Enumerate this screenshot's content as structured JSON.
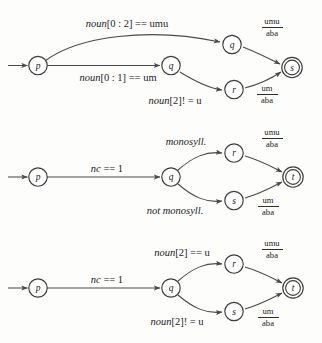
{
  "figure": {
    "background_color": "#fdfdfc",
    "stroke_color": "#4a4a4a",
    "text_color": "#1c1c1c"
  },
  "diagrams": [
    {
      "id": "diagram-1",
      "states": [
        {
          "name": "p",
          "label": "p",
          "accepting": false,
          "start": true
        },
        {
          "name": "q-main",
          "label": "q",
          "accepting": false,
          "start": false
        },
        {
          "name": "q-upper",
          "label": "q",
          "accepting": false,
          "start": false
        },
        {
          "name": "r",
          "label": "r",
          "accepting": false,
          "start": false
        },
        {
          "name": "s",
          "label": "s",
          "accepting": true,
          "start": false
        }
      ],
      "transitions": [
        {
          "from": "p",
          "to": "q-upper",
          "label": "noun[0 : 2] == umu",
          "italic_prefix": "noun"
        },
        {
          "from": "p",
          "to": "q-main",
          "label": "noun[0 : 1] == um",
          "italic_prefix": "noun"
        },
        {
          "from": "q-main",
          "to": "r",
          "label": "noun[2]! = u",
          "italic_prefix": "noun"
        },
        {
          "from": "q-upper",
          "to": "s",
          "numerator": "umu",
          "denominator": "aba"
        },
        {
          "from": "r",
          "to": "s",
          "numerator": "um",
          "denominator": "aba"
        }
      ]
    },
    {
      "id": "diagram-2",
      "states": [
        {
          "name": "p",
          "label": "p",
          "accepting": false,
          "start": true
        },
        {
          "name": "q",
          "label": "q",
          "accepting": false,
          "start": false
        },
        {
          "name": "r",
          "label": "r",
          "accepting": false,
          "start": false
        },
        {
          "name": "s",
          "label": "s",
          "accepting": false,
          "start": false
        },
        {
          "name": "t",
          "label": "t",
          "accepting": true,
          "start": false
        }
      ],
      "transitions": [
        {
          "from": "p",
          "to": "q",
          "label": "nc == 1",
          "italic_prefix": "nc"
        },
        {
          "from": "q",
          "to": "r",
          "label": "monosyll.",
          "italic": true
        },
        {
          "from": "q",
          "to": "s",
          "label": "not monosyll.",
          "italic": true
        },
        {
          "from": "r",
          "to": "t",
          "numerator": "umu",
          "denominator": "aba"
        },
        {
          "from": "s",
          "to": "t",
          "numerator": "um",
          "denominator": "aba"
        }
      ]
    },
    {
      "id": "diagram-3",
      "states": [
        {
          "name": "p",
          "label": "p",
          "accepting": false,
          "start": true
        },
        {
          "name": "q",
          "label": "q",
          "accepting": false,
          "start": false
        },
        {
          "name": "r",
          "label": "r",
          "accepting": false,
          "start": false
        },
        {
          "name": "s",
          "label": "s",
          "accepting": false,
          "start": false
        },
        {
          "name": "t",
          "label": "t",
          "accepting": true,
          "start": false
        }
      ],
      "transitions": [
        {
          "from": "p",
          "to": "q",
          "label": "nc == 1",
          "italic_prefix": "nc"
        },
        {
          "from": "q",
          "to": "r",
          "label": "noun[2] == u",
          "italic_prefix": "noun"
        },
        {
          "from": "q",
          "to": "s",
          "label": "noun[2]! = u",
          "italic_prefix": "noun"
        },
        {
          "from": "r",
          "to": "t",
          "numerator": "umu",
          "denominator": "aba"
        },
        {
          "from": "s",
          "to": "t",
          "numerator": "um",
          "denominator": "aba"
        }
      ]
    }
  ],
  "labels": {
    "d1_top": {
      "ital": "noun",
      "rest": "[0 : 2] == umu"
    },
    "d1_mid": {
      "ital": "noun",
      "rest": "[0 : 1] == um"
    },
    "d1_low": {
      "ital": "noun",
      "rest": "[2]! = u"
    },
    "d1_frac_top_num": "umu",
    "d1_frac_top_den": "aba",
    "d1_frac_bot_num": "um",
    "d1_frac_bot_den": "aba",
    "d2_main": {
      "ital": "nc",
      "rest": " == 1"
    },
    "d2_top": "monosyll.",
    "d2_bot": "not monosyll.",
    "d2_frac_top_num": "umu",
    "d2_frac_top_den": "aba",
    "d2_frac_bot_num": "um",
    "d2_frac_bot_den": "aba",
    "d3_main": {
      "ital": "nc",
      "rest": " == 1"
    },
    "d3_top": {
      "ital": "noun",
      "rest": "[2] == u"
    },
    "d3_bot": {
      "ital": "noun",
      "rest": "[2]! = u"
    },
    "d3_frac_top_num": "umu",
    "d3_frac_top_den": "aba",
    "d3_frac_bot_num": "um",
    "d3_frac_bot_den": "aba"
  },
  "states": {
    "d1_p": "p",
    "d1_q_main": "q",
    "d1_q_upper": "q",
    "d1_r": "r",
    "d1_s": "s",
    "d2_p": "p",
    "d2_q": "q",
    "d2_r": "r",
    "d2_s": "s",
    "d2_t": "t",
    "d3_p": "p",
    "d3_q": "q",
    "d3_r": "r",
    "d3_s": "s",
    "d3_t": "t"
  }
}
